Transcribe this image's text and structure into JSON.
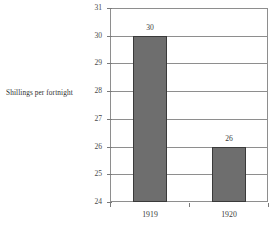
{
  "chart_data": {
    "type": "bar",
    "title": "",
    "subtitle": "",
    "xlabel": "",
    "ylabel": "Shillings per fortnight",
    "categories": [
      "1919",
      "1920"
    ],
    "values": [
      30,
      26
    ],
    "data_labels": [
      "30",
      "26"
    ],
    "ylim": [
      24,
      31
    ],
    "ytick_labels": [
      "24",
      "25",
      "26",
      "27",
      "28",
      "29",
      "30",
      "31"
    ],
    "ytick_values": [
      24,
      25,
      26,
      27,
      28,
      29,
      30,
      31
    ],
    "grid": true,
    "legend": false,
    "legend_position": "none",
    "colors": {
      "bar_fill": "#6e6e6e",
      "bar_border": "#3a3a3a",
      "grid": "#8e8e8e",
      "frame": "#8e8e8e",
      "text": "#3a3a3a",
      "background": "#ffffff"
    }
  }
}
